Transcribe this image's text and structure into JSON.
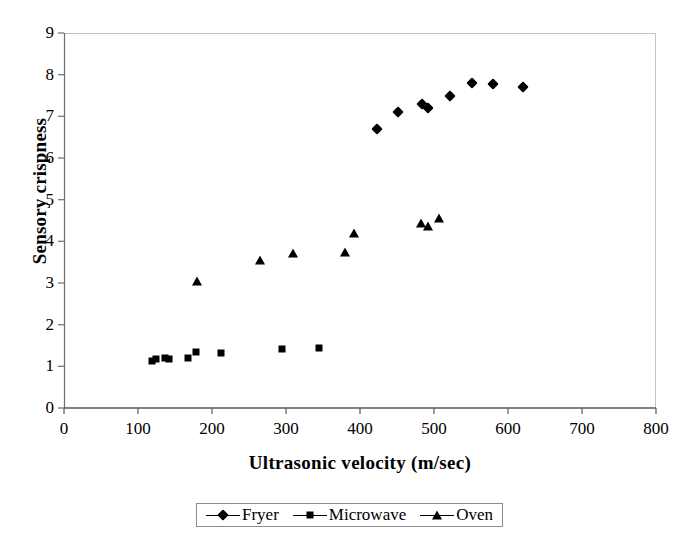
{
  "chart_data": {
    "type": "scatter",
    "title": "",
    "xlabel": "Ultrasonic velocity (m/sec)",
    "ylabel": "Sensory crispness",
    "xlim": [
      0,
      800
    ],
    "ylim": [
      0,
      9
    ],
    "xticks": [
      0,
      100,
      200,
      300,
      400,
      500,
      600,
      700,
      800
    ],
    "yticks": [
      0,
      1,
      2,
      3,
      4,
      5,
      6,
      7,
      8,
      9
    ],
    "grid": false,
    "legend_position": "bottom",
    "marker_color": "#000000",
    "frame_color": "#b0b0b0",
    "axis_color": "#555555",
    "series": [
      {
        "name": "Fryer",
        "marker": "diamond",
        "points": [
          [
            423,
            6.7
          ],
          [
            452,
            7.11
          ],
          [
            484,
            7.29
          ],
          [
            492,
            7.21
          ],
          [
            521,
            7.48
          ],
          [
            552,
            7.8
          ],
          [
            580,
            7.77
          ],
          [
            620,
            7.7
          ]
        ]
      },
      {
        "name": "Microwave",
        "marker": "square",
        "points": [
          [
            119,
            1.12
          ],
          [
            124,
            1.18
          ],
          [
            136,
            1.2
          ],
          [
            142,
            1.17
          ],
          [
            168,
            1.2
          ],
          [
            178,
            1.34
          ],
          [
            212,
            1.32
          ],
          [
            294,
            1.42
          ],
          [
            345,
            1.45
          ]
        ]
      },
      {
        "name": "Oven",
        "marker": "triangle",
        "points": [
          [
            180,
            3.05
          ],
          [
            265,
            3.55
          ],
          [
            310,
            3.73
          ],
          [
            380,
            3.74
          ],
          [
            392,
            4.21
          ],
          [
            482,
            4.45
          ],
          [
            492,
            4.36
          ],
          [
            507,
            4.57
          ]
        ]
      }
    ]
  },
  "legend": {
    "items": [
      {
        "label": "Fryer",
        "marker": "diamond"
      },
      {
        "label": "Microwave",
        "marker": "square"
      },
      {
        "label": "Oven",
        "marker": "triangle"
      }
    ]
  }
}
